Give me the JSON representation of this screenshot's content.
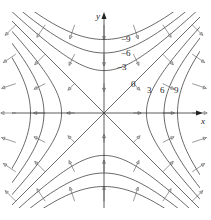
{
  "figure": {
    "axes": {
      "x_label": "x",
      "y_label": "y"
    },
    "level_labels": {
      "neg9": "−9",
      "neg6": "−6",
      "neg3": "−3",
      "zero": "0",
      "pos3": "3",
      "pos6": "6",
      "pos9": "9"
    },
    "levels": [
      -9,
      -6,
      -3,
      0,
      3,
      6,
      9
    ],
    "colors": {
      "curve": "#444444",
      "axis": "#333333",
      "vector": "#555555",
      "arrowhead": "#cccccc"
    }
  }
}
